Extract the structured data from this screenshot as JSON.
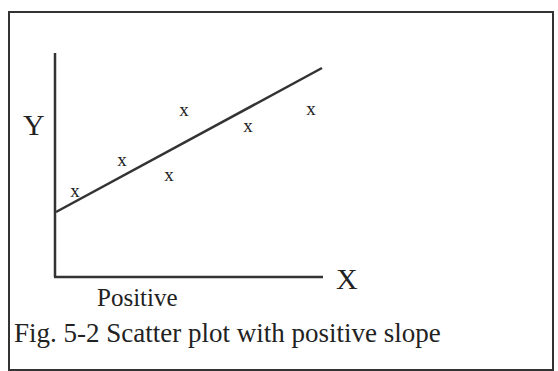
{
  "chart_data": {
    "type": "scatter",
    "title": "Fig. 5-2 Scatter plot with positive slope",
    "subtitle": "Positive",
    "xlabel": "X",
    "ylabel": "Y",
    "grid": false,
    "legend": null,
    "marker": "x",
    "points": [
      {
        "x": 20,
        "y": 24
      },
      {
        "x": 67,
        "y": 41
      },
      {
        "x": 114,
        "y": 29
      },
      {
        "x": 129,
        "y": 55
      },
      {
        "x": 193,
        "y": 47
      },
      {
        "x": 256,
        "y": 53
      }
    ],
    "trend_line": {
      "x0": 0,
      "y0": 20,
      "x1": 267,
      "y1": 66
    },
    "xlim": [
      0,
      268
    ],
    "ylim": [
      0,
      75
    ]
  },
  "labels": {
    "y_axis": "Y",
    "x_axis": "X",
    "subtitle": "Positive",
    "caption": "Fig. 5-2 Scatter plot with positive slope",
    "marker_glyph": "x"
  }
}
